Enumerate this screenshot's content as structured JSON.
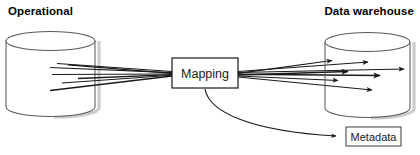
{
  "diagram": {
    "title_left": "Operational",
    "title_right": "Data warehouse",
    "background_color": "#ffffff",
    "stroke_color": "#1a1a1a",
    "cylinder_stroke_color": "#4d4d4d",
    "shadow_color": "#c8c8c8",
    "nodes": {
      "source_database": {
        "label": "Operational",
        "shape": "cylinder"
      },
      "mapping_box": {
        "label": "Mapping",
        "shape": "rectangle"
      },
      "target_database": {
        "label": "Data warehouse",
        "shape": "cylinder"
      },
      "metadata_box": {
        "label": "Metadata",
        "shape": "rectangle"
      }
    },
    "edges": {
      "source_to_mapping_count": 7,
      "mapping_to_target_count": 7,
      "mapping_to_metadata": {
        "style": "curved",
        "arrowhead": true
      }
    }
  }
}
